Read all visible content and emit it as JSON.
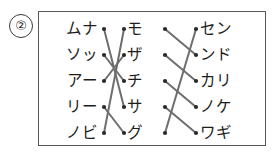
{
  "item": {
    "number_label": "②"
  },
  "puzzle": {
    "type": "three-column-matching",
    "columns": {
      "left": {
        "name": "left-column",
        "items": [
          {
            "id": "L1",
            "text": "ムナ"
          },
          {
            "id": "L2",
            "text": "ソッ"
          },
          {
            "id": "L3",
            "text": "アー"
          },
          {
            "id": "L4",
            "text": "リー"
          },
          {
            "id": "L5",
            "text": "ノビ"
          }
        ]
      },
      "middle": {
        "name": "middle-column",
        "items": [
          {
            "id": "M1",
            "text": "モ"
          },
          {
            "id": "M2",
            "text": "ザ"
          },
          {
            "id": "M3",
            "text": "チ"
          },
          {
            "id": "M4",
            "text": "サ"
          },
          {
            "id": "M5",
            "text": "グ"
          }
        ]
      },
      "right": {
        "name": "right-column",
        "items": [
          {
            "id": "R1",
            "text": "セン"
          },
          {
            "id": "R2",
            "text": "ンド"
          },
          {
            "id": "R3",
            "text": "カリ"
          },
          {
            "id": "R4",
            "text": "ノケ"
          },
          {
            "id": "R5",
            "text": "ワギ"
          }
        ]
      }
    },
    "connections": {
      "left_to_middle": [
        {
          "from": "L1",
          "to": "M4"
        },
        {
          "from": "L2",
          "to": "M3"
        },
        {
          "from": "L3",
          "to": "M2"
        },
        {
          "from": "L4",
          "to": "M5"
        },
        {
          "from": "L5",
          "to": "M1"
        }
      ],
      "middle_to_right": [
        {
          "from": "M1",
          "to": "R2"
        },
        {
          "from": "M2",
          "to": "R3"
        },
        {
          "from": "M3",
          "to": "R4"
        },
        {
          "from": "M4",
          "to": "R5"
        },
        {
          "from": "M5",
          "to": "R1"
        }
      ]
    }
  },
  "style": {
    "line_color": "#6e6e6e",
    "dot_color": "#2a2a2a",
    "border_color": "#575757",
    "text_color": "#1d1d1d",
    "background": "#ffffff"
  }
}
